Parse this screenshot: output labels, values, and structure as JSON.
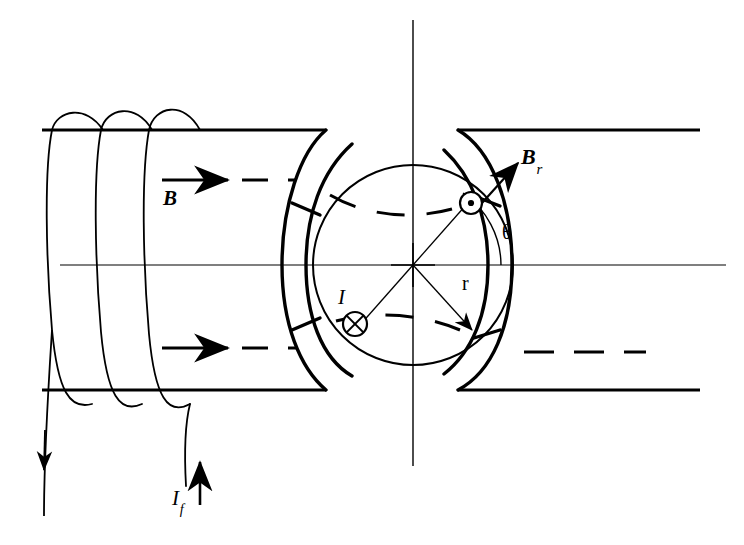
{
  "figure": {
    "background_color": "#ffffff",
    "line_color": "#000000",
    "width": 744,
    "height": 545
  },
  "labels": {
    "b_field": "B",
    "b_radial_main": "B",
    "b_radial_sub": "r",
    "theta": "θ",
    "radius": "r",
    "conductor_current": "I",
    "field_current_main": "I",
    "field_current_sub": "f"
  },
  "symbols": {
    "current_out_of_page": "circle-dot-icon",
    "current_into_page": "circle-cross-icon",
    "b_field_arrow": "arrow-right-icon",
    "b_radial_arrow": "arrow-diagonal-icon",
    "field_current_arrow": "arrow-up-icon",
    "return_current_arrow": "arrow-down-icon"
  },
  "geometry": {
    "center_x": 413,
    "center_y": 265,
    "rotor_radius": 100,
    "stator_inner_radius": 118,
    "stator_outer_radius": 140,
    "top_rail_y": 130,
    "bottom_rail_y": 390,
    "vertical_axis_x": 413,
    "vertical_axis_top": 20,
    "vertical_axis_bottom": 466,
    "horizontal_axis_y": 265,
    "theta_degrees": 55
  },
  "annotations": {
    "b_field_line_upper_y": 180,
    "b_field_line_lower_y": 348,
    "dashed_flux_right_y": 352
  }
}
